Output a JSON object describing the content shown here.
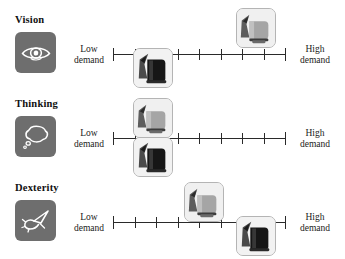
{
  "chart_data": {
    "type": "scatter",
    "title": "",
    "xlabel": "",
    "ylabel": "",
    "scale": {
      "min_label": "Low\ndemand",
      "max_label": "High\ndemand",
      "tick_count": 9,
      "xlim": [
        1,
        9
      ],
      "grid": false,
      "legend": "none"
    },
    "categories": [
      "Vision",
      "Thinking",
      "Dexterity"
    ],
    "series": [
      {
        "name": "silver-kettle",
        "values": [
          7,
          2,
          5
        ]
      },
      {
        "name": "black-kettle",
        "values": [
          2,
          2,
          7
        ]
      }
    ]
  },
  "rows": [
    {
      "label": "Vision",
      "icon": "eye-icon",
      "low": {
        "line1": "Low",
        "line2": "demand"
      },
      "high": {
        "line1": "High",
        "line2": "demand"
      },
      "ticks": 9,
      "markers": [
        {
          "name": "silver-kettle-marker",
          "value": 7,
          "placement": "above"
        },
        {
          "name": "black-kettle-marker",
          "value": 2,
          "placement": "below"
        }
      ]
    },
    {
      "label": "Thinking",
      "icon": "thought-bubble-icon",
      "low": {
        "line1": "Low",
        "line2": "demand"
      },
      "high": {
        "line1": "High",
        "line2": "demand"
      },
      "ticks": 9,
      "markers": [
        {
          "name": "silver-kettle-marker",
          "value": 2,
          "placement": "above"
        },
        {
          "name": "black-kettle-marker",
          "value": 2,
          "placement": "below"
        }
      ]
    },
    {
      "label": "Dexterity",
      "icon": "hand-pinch-icon",
      "low": {
        "line1": "Low",
        "line2": "demand"
      },
      "high": {
        "line1": "High",
        "line2": "demand"
      },
      "ticks": 9,
      "markers": [
        {
          "name": "silver-kettle-marker",
          "value": 5,
          "placement": "above"
        },
        {
          "name": "black-kettle-marker",
          "value": 7,
          "placement": "below"
        }
      ]
    }
  ],
  "colors": {
    "icon_tile": "#6e6e6e",
    "axis": "#2a2a2a",
    "text": "#111111",
    "marker_border": "#b4b4b4",
    "silver_kettle": "#9a9a9a",
    "black_kettle": "#1d1d1d"
  }
}
